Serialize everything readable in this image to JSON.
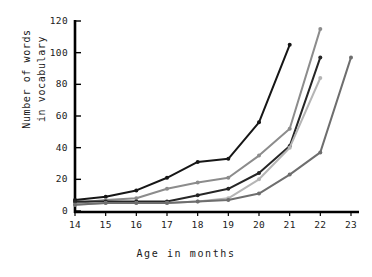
{
  "chart_data": {
    "type": "line",
    "title": "",
    "xlabel": "Age in months",
    "ylabel": "Number of words\nin vocabulary",
    "x": [
      14,
      15,
      16,
      17,
      18,
      19,
      20,
      21,
      22,
      23
    ],
    "xlim": [
      14,
      23
    ],
    "ylim": [
      0,
      120
    ],
    "yticks": [
      0,
      20,
      40,
      60,
      80,
      100,
      120
    ],
    "xticks": [
      14,
      15,
      16,
      17,
      18,
      19,
      20,
      21,
      22,
      23
    ],
    "grid": false,
    "legend": "none",
    "series": [
      {
        "name": "child-1",
        "color": "#161616",
        "x": [
          14,
          15,
          16,
          17,
          18,
          19,
          20,
          21
        ],
        "values": [
          7,
          9,
          13,
          21,
          31,
          33,
          56,
          105
        ]
      },
      {
        "name": "child-2",
        "color": "#8c8c8c",
        "x": [
          14,
          15,
          16,
          17,
          18,
          19,
          20,
          21,
          22
        ],
        "values": [
          5,
          7,
          8,
          14,
          18,
          21,
          35,
          52,
          115
        ]
      },
      {
        "name": "child-3",
        "color": "#262626",
        "x": [
          14,
          15,
          16,
          17,
          18,
          19,
          20,
          21,
          22
        ],
        "values": [
          6,
          6,
          6,
          6,
          10,
          14,
          24,
          41,
          97
        ]
      },
      {
        "name": "child-4",
        "color": "#b5b5b5",
        "x": [
          14,
          15,
          16,
          17,
          18,
          19,
          20,
          21,
          22
        ],
        "values": [
          4,
          5,
          5,
          5,
          6,
          8,
          20,
          40,
          84
        ]
      },
      {
        "name": "child-5",
        "color": "#6e6e6e",
        "x": [
          14,
          15,
          16,
          17,
          18,
          19,
          20,
          21,
          22,
          23
        ],
        "values": [
          4,
          5,
          5,
          5,
          6,
          7,
          11,
          23,
          37,
          97
        ]
      }
    ],
    "axis_color": "#000000",
    "tick_labels_x": [
      "14",
      "15",
      "16",
      "17",
      "18",
      "19",
      "20",
      "21",
      "22",
      "23"
    ],
    "tick_labels_y": [
      "0",
      "20",
      "40",
      "60",
      "80",
      "100",
      "120"
    ]
  }
}
